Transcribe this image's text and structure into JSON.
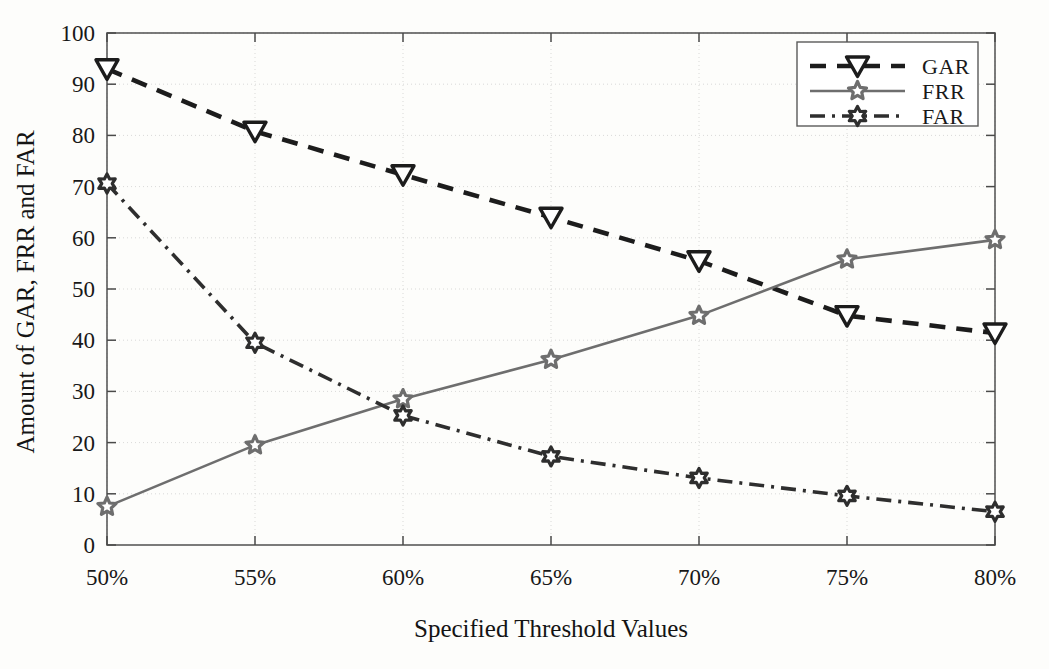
{
  "figure": {
    "background_color": "#fdfdfb",
    "plot_area": {
      "left": 107,
      "top": 33,
      "right": 995,
      "bottom": 545
    }
  },
  "axes": {
    "x_title": "Specified Threshold Values",
    "y_title": "Amount of GAR, FRR and FAR",
    "x_tick_labels": [
      "50%",
      "55%",
      "60%",
      "65%",
      "70%",
      "75%",
      "80%"
    ],
    "y_tick_labels": [
      "0",
      "10",
      "20",
      "30",
      "40",
      "50",
      "60",
      "70",
      "80",
      "90",
      "100"
    ]
  },
  "legend": {
    "position": "top-right",
    "entries": [
      {
        "label": "GAR",
        "style": "dashed",
        "marker": "triangle-down",
        "color": "#1c1c1c"
      },
      {
        "label": "FRR",
        "style": "solid",
        "marker": "pentagram",
        "color": "#6e6e6e"
      },
      {
        "label": "FAR",
        "style": "dash-dot",
        "marker": "hexagram",
        "color": "#2e2e2e"
      }
    ]
  },
  "chart_data": {
    "type": "line",
    "title": "",
    "xlabel": "Specified Threshold Values",
    "ylabel": "Amount of GAR, FRR and FAR",
    "categories": [
      "50%",
      "55%",
      "60%",
      "65%",
      "70%",
      "75%",
      "80%"
    ],
    "x": [
      50,
      55,
      60,
      65,
      70,
      75,
      80
    ],
    "xlim": [
      50,
      80
    ],
    "ylim": [
      0,
      100
    ],
    "yticks": [
      0,
      10,
      20,
      30,
      40,
      50,
      60,
      70,
      80,
      90,
      100
    ],
    "grid": true,
    "legend_position": "upper right",
    "series": [
      {
        "name": "GAR",
        "color": "#1c1c1c",
        "linestyle": "dashed",
        "marker": "triangle-down",
        "values": [
          93.0,
          80.8,
          72.3,
          64.0,
          55.5,
          44.8,
          41.4
        ]
      },
      {
        "name": "FRR",
        "color": "#6e6e6e",
        "linestyle": "solid",
        "marker": "pentagram",
        "values": [
          7.5,
          19.5,
          28.5,
          36.2,
          44.8,
          55.8,
          59.6
        ]
      },
      {
        "name": "FAR",
        "color": "#2e2e2e",
        "linestyle": "dash-dot",
        "marker": "hexagram",
        "values": [
          70.6,
          39.5,
          25.3,
          17.3,
          13.1,
          9.6,
          6.5
        ]
      }
    ]
  }
}
